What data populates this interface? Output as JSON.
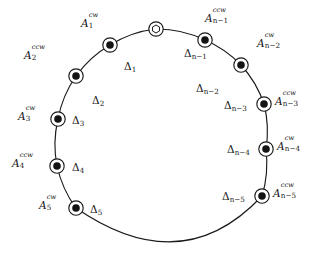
{
  "figure": {
    "type": "ring-diagram",
    "background_color": "#ffffff",
    "stroke_color": "#1a1a1a",
    "node_fill_color": "#141414",
    "node_ring_color": "#ffffff"
  },
  "circle": {
    "center_x": 158,
    "center_y": 136,
    "radius": 108
  },
  "nodes": [
    {
      "id": "origin",
      "marker": "hexagon-in-circle",
      "filled": false,
      "label": "",
      "x": 156,
      "y": 29,
      "angle_deg": -89
    },
    {
      "id": "A1",
      "marker": "dot-in-circle",
      "filled": true,
      "base": "A",
      "sub": "1",
      "sup": "cw",
      "x": 110,
      "y": 45,
      "angle_deg": -114
    },
    {
      "id": "A2",
      "marker": "dot-in-circle",
      "filled": true,
      "base": "A",
      "sub": "2",
      "sup": "ccw",
      "x": 76,
      "y": 76,
      "angle_deg": -139
    },
    {
      "id": "A3",
      "marker": "dot-in-circle",
      "filled": true,
      "base": "A",
      "sub": "3",
      "sup": "cw",
      "x": 58,
      "y": 119,
      "angle_deg": -171
    },
    {
      "id": "A4",
      "marker": "dot-in-circle",
      "filled": true,
      "base": "A",
      "sub": "4",
      "sup": "ccw",
      "x": 57,
      "y": 166,
      "angle_deg": 164
    },
    {
      "id": "A5",
      "marker": "dot-in-circle",
      "filled": true,
      "base": "A",
      "sub": "5",
      "sup": "cw",
      "x": 76,
      "y": 208,
      "angle_deg": 137
    },
    {
      "id": "An5",
      "marker": "dot-in-circle",
      "filled": true,
      "base": "A",
      "sub": "n−5",
      "sup": "ccw",
      "x": 262,
      "y": 196,
      "angle_deg": 28
    },
    {
      "id": "An4",
      "marker": "dot-in-circle",
      "filled": true,
      "base": "A",
      "sub": "n−4",
      "sup": "cw",
      "x": 266,
      "y": 149,
      "angle_deg": 7
    },
    {
      "id": "An3",
      "marker": "dot-in-circle",
      "filled": true,
      "base": "A",
      "sub": "n−3",
      "sup": "ccw",
      "x": 264,
      "y": 104,
      "angle_deg": -17
    },
    {
      "id": "An2",
      "marker": "dot-in-circle",
      "filled": true,
      "base": "A",
      "sub": "n−2",
      "sup": "cw",
      "x": 241,
      "y": 65,
      "angle_deg": -43
    },
    {
      "id": "An1",
      "marker": "dot-in-circle",
      "filled": true,
      "base": "A",
      "sub": "n−1",
      "sup": "ccw",
      "x": 205,
      "y": 40,
      "angle_deg": -66
    }
  ],
  "node_labels": {
    "A1": {
      "base": "A",
      "sup": "cw",
      "sub": "1",
      "x": 81,
      "y": 18
    },
    "A2": {
      "base": "A",
      "sup": "ccw",
      "sub": "2",
      "x": 24,
      "y": 50
    },
    "A3": {
      "base": "A",
      "sup": "cw",
      "sub": "3",
      "x": 18,
      "y": 111
    },
    "A4": {
      "base": "A",
      "sup": "ccw",
      "sub": "4",
      "x": 12,
      "y": 158
    },
    "A5": {
      "base": "A",
      "sup": "cw",
      "sub": "5",
      "x": 39,
      "y": 200
    },
    "An1": {
      "base": "A",
      "sup": "ccw",
      "sub": "n−1",
      "x": 205,
      "y": 13
    },
    "An2": {
      "base": "A",
      "sup": "cw",
      "sub": "n−2",
      "x": 257,
      "y": 38
    },
    "An3": {
      "base": "A",
      "sup": "ccw",
      "sub": "n−3",
      "x": 275,
      "y": 96
    },
    "An4": {
      "base": "A",
      "sup": "cw",
      "sub": "n−4",
      "x": 277,
      "y": 141
    },
    "An5": {
      "base": "A",
      "sup": "ccw",
      "sub": "n−5",
      "x": 273,
      "y": 188
    }
  },
  "gap_labels": [
    {
      "id": "D1",
      "base": "Δ",
      "sub": "1",
      "x": 124,
      "y": 61
    },
    {
      "id": "D2",
      "base": "Δ",
      "sub": "2",
      "x": 92,
      "y": 95
    },
    {
      "id": "D3",
      "base": "Δ",
      "sub": "3",
      "x": 72,
      "y": 115
    },
    {
      "id": "D4",
      "base": "Δ",
      "sub": "4",
      "x": 72,
      "y": 162
    },
    {
      "id": "D5",
      "base": "Δ",
      "sub": "5",
      "x": 90,
      "y": 204
    },
    {
      "id": "Dn1",
      "base": "Δ",
      "sub": "n−1",
      "x": 184,
      "y": 48
    },
    {
      "id": "Dn2",
      "base": "Δ",
      "sub": "n−2",
      "x": 196,
      "y": 83
    },
    {
      "id": "Dn3",
      "base": "Δ",
      "sub": "n−3",
      "x": 224,
      "y": 100
    },
    {
      "id": "Dn4",
      "base": "Δ",
      "sub": "n−4",
      "x": 227,
      "y": 144
    },
    {
      "id": "Dn5",
      "base": "Δ",
      "sub": "n−5",
      "x": 222,
      "y": 191
    }
  ]
}
